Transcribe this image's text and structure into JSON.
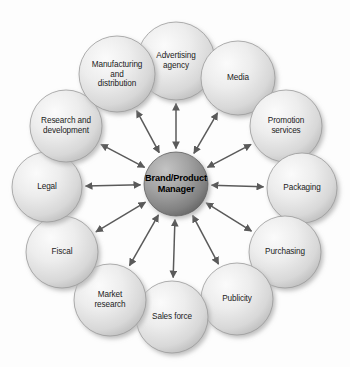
{
  "diagram": {
    "center": {
      "label": "Brand/Product\nManager",
      "line1": "Brand/Product",
      "line2": "Manager",
      "fill_light": "#b9b9b9",
      "fill_dark": "#6e6e6e",
      "text_color": "#000000",
      "radius": 32,
      "cx": 176,
      "cy": 184
    },
    "arrow": {
      "style": "double-headed",
      "color": "#5a5a5a",
      "stroke_width": 1.5
    },
    "node_style": {
      "fill_light": "#f2f2f2",
      "fill_mid": "#dcdcdc",
      "fill_dark": "#bdbdbd",
      "outline": "#9a9a9a",
      "shadow": "#cfcfcf",
      "text_color": "#1b1b1b"
    },
    "background": "#fdfdfd",
    "nodes": [
      {
        "id": "advertising-agency",
        "label": "Advertising\nagency",
        "cx": 176,
        "cy": 61,
        "r": 39,
        "angle": -90
      },
      {
        "id": "media",
        "label": "Media",
        "cx": 238,
        "cy": 78,
        "r": 37,
        "angle": -60
      },
      {
        "id": "promotion-services",
        "label": "Promotion\nservices",
        "cx": 286,
        "cy": 126,
        "r": 36,
        "angle": -30
      },
      {
        "id": "packaging",
        "label": "Packaging",
        "cx": 302,
        "cy": 188,
        "r": 35,
        "angle": 0
      },
      {
        "id": "purchasing",
        "label": "Purchasing",
        "cx": 285,
        "cy": 252,
        "r": 36,
        "angle": 30
      },
      {
        "id": "publicity",
        "label": "Publicity",
        "cx": 237,
        "cy": 299,
        "r": 36,
        "angle": 60
      },
      {
        "id": "sales-force",
        "label": "Sales force",
        "cx": 172,
        "cy": 317,
        "r": 36,
        "angle": 90
      },
      {
        "id": "market-research",
        "label": "Market\nresearch",
        "cx": 110,
        "cy": 300,
        "r": 36,
        "angle": 120
      },
      {
        "id": "fiscal",
        "label": "Fiscal",
        "cx": 62,
        "cy": 252,
        "r": 36,
        "angle": 150
      },
      {
        "id": "legal",
        "label": "Legal",
        "cx": 47,
        "cy": 187,
        "r": 35,
        "angle": 180
      },
      {
        "id": "research-and-development",
        "label": "Research and\ndevelopment",
        "cx": 66,
        "cy": 126,
        "r": 36,
        "angle": 210
      },
      {
        "id": "manufacturing-and-distribution",
        "label": "Manufacturing\nand\ndistribution",
        "cx": 117,
        "cy": 74,
        "r": 38,
        "angle": 240
      }
    ]
  }
}
